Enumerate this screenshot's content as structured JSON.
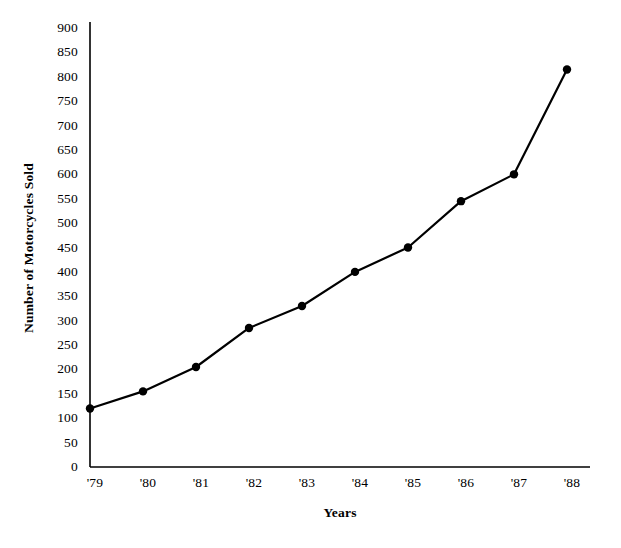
{
  "chart_data": {
    "type": "line",
    "title": "",
    "xlabel": "Years",
    "ylabel": "Number of Motorcycles Sold",
    "categories": [
      "'79",
      "'80",
      "'81",
      "'82",
      "'83",
      "'84",
      "'85",
      "'86",
      "'87",
      "'88"
    ],
    "values": [
      120,
      155,
      205,
      285,
      330,
      400,
      450,
      545,
      600,
      815
    ],
    "series": [
      {
        "name": "Number of Motorcycles Sold",
        "values": [
          120,
          155,
          205,
          285,
          330,
          400,
          450,
          545,
          600,
          815
        ]
      }
    ],
    "ylim": [
      0,
      900
    ],
    "y_ticks": [
      0,
      50,
      100,
      150,
      200,
      250,
      300,
      350,
      400,
      450,
      500,
      550,
      600,
      650,
      700,
      750,
      800,
      850,
      900
    ],
    "y_tick_labels": [
      "0",
      "50",
      "100",
      "150",
      "200",
      "250",
      "300",
      "350",
      "400",
      "450",
      "500",
      "550",
      "600",
      "650",
      "700",
      "750",
      "800",
      "850",
      "900"
    ],
    "x_tick_labels": [
      "'79",
      "'80",
      "'81",
      "'82",
      "'83",
      "'84",
      "'85",
      "'86",
      "'87",
      "'88"
    ],
    "grid": false,
    "legend": "none",
    "line_color": "#000000",
    "marker": "circle",
    "marker_color": "#000000",
    "axis_color": "#000000",
    "background_color": "#ffffff"
  }
}
